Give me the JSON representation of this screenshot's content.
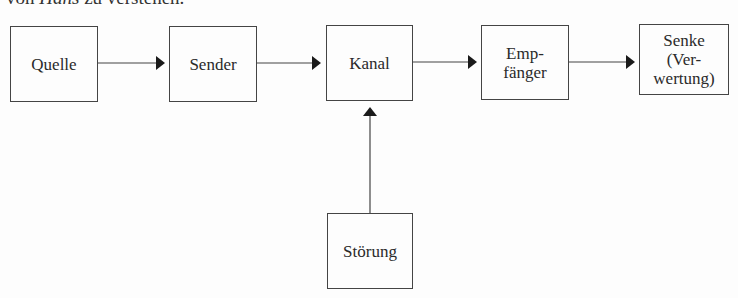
{
  "header_fragment": {
    "pre": "von ",
    "italic": "Hans",
    "post": " zu verstehen."
  },
  "diagram": {
    "nodes": [
      {
        "id": "quelle",
        "label_lines": [
          "Quelle"
        ]
      },
      {
        "id": "sender",
        "label_lines": [
          "Sender"
        ]
      },
      {
        "id": "kanal",
        "label_lines": [
          "Kanal"
        ]
      },
      {
        "id": "empfaenger",
        "label_lines": [
          "Emp-",
          "fänger"
        ]
      },
      {
        "id": "senke",
        "label_lines": [
          "Senke",
          "(Ver-",
          "wertung)"
        ]
      },
      {
        "id": "stoerung",
        "label_lines": [
          "Störung"
        ]
      }
    ],
    "edges": [
      {
        "from": "quelle",
        "to": "sender"
      },
      {
        "from": "sender",
        "to": "kanal"
      },
      {
        "from": "kanal",
        "to": "empfaenger"
      },
      {
        "from": "empfaenger",
        "to": "senke"
      },
      {
        "from": "stoerung",
        "to": "kanal"
      }
    ],
    "colors": {
      "line": "#444444",
      "arrowhead": "#1a1a1a",
      "background": "#fdfdfd"
    }
  }
}
